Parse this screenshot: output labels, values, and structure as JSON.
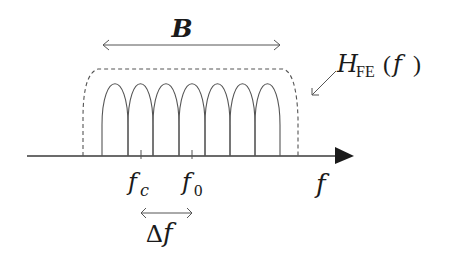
{
  "diagram": {
    "colors": {
      "line": "#555555",
      "axis": "#3a3a3a",
      "text": "#1a1a1a",
      "background": "#ffffff"
    },
    "labels": {
      "bandwidth": "B",
      "filter_main": "H",
      "filter_sub": "FE",
      "filter_arg_open": "(",
      "filter_arg": "f",
      "filter_arg_close": ")",
      "axis": "f",
      "fc_main": "f",
      "fc_sub": "c",
      "f0_main": "f",
      "f0_sub": "0",
      "spacing_delta": "Δ",
      "spacing_f": "f"
    },
    "subcarriers": {
      "count": 7,
      "boundaries_px": [
        102,
        128,
        153,
        179,
        205,
        230,
        255,
        280
      ],
      "marked": [
        {
          "name": "fc",
          "index": 1
        },
        {
          "name": "f0",
          "index": 3
        }
      ]
    },
    "filter_response": {
      "style": "dashed",
      "left_edge_px": 83,
      "right_edge_px": 298,
      "top_px": 68
    },
    "arrows": [
      {
        "name": "bandwidth-B",
        "type": "double",
        "from_px": 102,
        "to_px": 280
      },
      {
        "name": "spacing-delta-f",
        "type": "double",
        "from_px": 141,
        "to_px": 192
      },
      {
        "name": "filter-pointer",
        "type": "single"
      }
    ]
  }
}
